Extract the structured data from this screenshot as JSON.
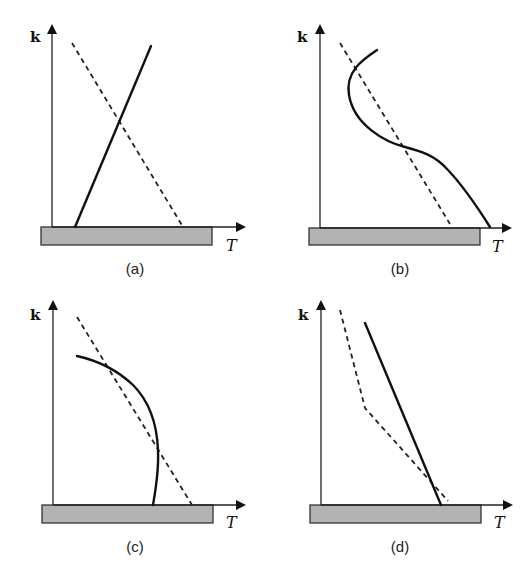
{
  "figure": {
    "panels": [
      {
        "id": "a",
        "label": "(a)",
        "y_axis_label": "k",
        "x_axis_label": "T",
        "solid_curve": "straight line rising with T",
        "dashed_curve": "straight line falling with T"
      },
      {
        "id": "b",
        "label": "(b)",
        "y_axis_label": "k",
        "x_axis_label": "T",
        "solid_curve": "S-shaped curve decreasing with T, crossing dashed line twice",
        "dashed_curve": "straight line falling with T"
      },
      {
        "id": "c",
        "label": "(c)",
        "y_axis_label": "k",
        "x_axis_label": "T",
        "solid_curve": "concave curve bending down to near-vertical, crossing dashed line twice",
        "dashed_curve": "straight line falling with T"
      },
      {
        "id": "d",
        "label": "(d)",
        "y_axis_label": "k",
        "x_axis_label": "T",
        "solid_curve": "straight line falling with T",
        "dashed_curve": "piecewise line with a kink, steep then shallow, crossing solid near base"
      }
    ],
    "colors": {
      "line": "#111111",
      "wall_fill": "#b3b3b3",
      "wall_stroke": "#333333",
      "background": "#ffffff"
    }
  }
}
